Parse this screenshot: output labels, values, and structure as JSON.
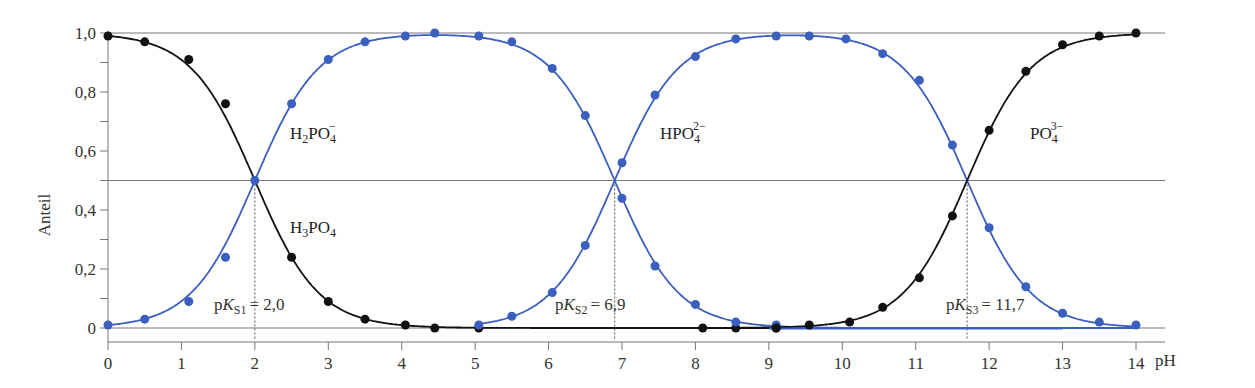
{
  "chart_data": {
    "type": "line",
    "title": "",
    "xlabel": "pH",
    "ylabel": "Anteil",
    "xlim": [
      0,
      14
    ],
    "ylim": [
      0,
      1.0
    ],
    "x_ticks": [
      "0",
      "1",
      "2",
      "3",
      "4",
      "5",
      "6",
      "7",
      "8",
      "9",
      "10",
      "11",
      "12",
      "13",
      "14"
    ],
    "y_ticks": [
      "0",
      "0,2",
      "0,4",
      "0,6",
      "0,8",
      "1,0"
    ],
    "grid": false,
    "reference_lines": [
      1.0,
      0.5,
      0.0
    ],
    "pKa": [
      {
        "label_prefix": "pK",
        "label_sub": "S1",
        "label_value": "= 2,0",
        "value": 2.0
      },
      {
        "label_prefix": "pK",
        "label_sub": "S2",
        "label_value": "= 6,9",
        "value": 6.9
      },
      {
        "label_prefix": "pK",
        "label_sub": "S3",
        "label_value": "= 11,7",
        "value": 11.7
      }
    ],
    "series": [
      {
        "name": "H3PO4",
        "label_main": "H",
        "label_sub1": "3",
        "label_mid": "PO",
        "label_sub2": "4",
        "label_sup": "",
        "color": "#111111",
        "x": [
          0,
          0.5,
          1.1,
          1.6,
          2.5,
          3.0,
          3.5,
          4.05,
          4.45,
          5.05,
          8.1,
          8.55,
          9.1
        ],
        "values": [
          0.99,
          0.97,
          0.91,
          0.76,
          0.24,
          0.09,
          0.03,
          0.01,
          0.0,
          0.0,
          0.0,
          0.0,
          0.0
        ]
      },
      {
        "name": "H2PO4-",
        "label_main": "H",
        "label_sub1": "2",
        "label_mid": "PO",
        "label_sub2": "4",
        "label_sup": "−",
        "color": "#3a5fbf",
        "x": [
          0,
          0.5,
          1.1,
          1.6,
          2.0,
          2.5,
          3.0,
          3.5,
          4.05,
          4.45,
          5.05,
          5.5,
          6.05,
          6.5,
          7.0,
          7.45,
          8.0,
          8.55,
          9.1
        ],
        "values": [
          0.01,
          0.03,
          0.09,
          0.24,
          0.5,
          0.76,
          0.91,
          0.97,
          0.99,
          1.0,
          0.99,
          0.97,
          0.88,
          0.72,
          0.44,
          0.21,
          0.08,
          0.02,
          0.01
        ]
      },
      {
        "name": "HPO4 2-",
        "label_main": "",
        "label_sub1": "",
        "label_mid": "HPO",
        "label_sub2": "4",
        "label_sup": "2−",
        "color": "#3a5fbf",
        "x": [
          5.05,
          5.5,
          6.05,
          6.5,
          7.0,
          7.45,
          8.0,
          8.55,
          9.1,
          9.55,
          10.05,
          10.55,
          11.05,
          11.5,
          12.0,
          12.5,
          13.0,
          13.5,
          14.0
        ],
        "values": [
          0.01,
          0.04,
          0.12,
          0.28,
          0.56,
          0.79,
          0.92,
          0.98,
          0.99,
          0.99,
          0.98,
          0.93,
          0.84,
          0.62,
          0.34,
          0.14,
          0.05,
          0.02,
          0.01
        ]
      },
      {
        "name": "PO4 3-",
        "label_main": "",
        "label_sub1": "",
        "label_mid": "PO",
        "label_sub2": "4",
        "label_sup": "3−",
        "color": "#111111",
        "x": [
          9.1,
          9.55,
          10.1,
          10.55,
          11.05,
          11.5,
          12.0,
          12.5,
          13.0,
          13.5,
          14.0
        ],
        "values": [
          0.0,
          0.01,
          0.02,
          0.07,
          0.17,
          0.38,
          0.67,
          0.87,
          0.96,
          0.99,
          1.0
        ]
      }
    ]
  }
}
